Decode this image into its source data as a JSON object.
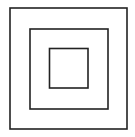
{
  "diagram": {
    "stroke_color": "#222222",
    "background": "#ffffff",
    "squares": [
      {
        "name": "outer",
        "x": 10,
        "y": 8,
        "w": 117,
        "h": 121
      },
      {
        "name": "middle",
        "x": 30,
        "y": 29,
        "w": 78,
        "h": 80
      },
      {
        "name": "inner",
        "x": 49.5,
        "y": 48.5,
        "w": 38.5,
        "h": 39.5
      }
    ]
  }
}
